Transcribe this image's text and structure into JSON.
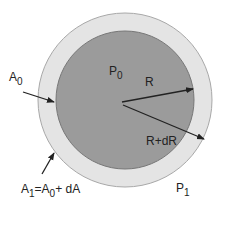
{
  "diagram": {
    "colors": {
      "background": "#ffffff",
      "outer_ring": "#e4e4e4",
      "outer_stroke": "#a8a8a8",
      "inner_disk": "#9b9b9b",
      "inner_stroke": "#777777",
      "arrow": "#222222"
    },
    "labels": {
      "p0": {
        "base": "P",
        "sub": "0"
      },
      "p1": {
        "base": "P",
        "sub": "1"
      },
      "a0": {
        "base": "A",
        "sub": "0"
      },
      "a1": {
        "base": "A",
        "sub": "1",
        "eq": "=A",
        "sub2": "0",
        "tail": "+ dA"
      },
      "r": "R",
      "r_dr": "R+dR"
    }
  }
}
